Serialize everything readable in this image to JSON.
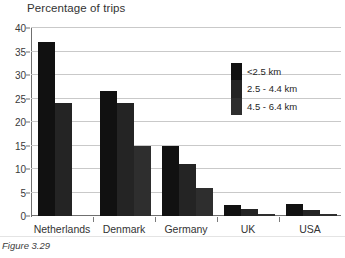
{
  "chart_data": {
    "type": "bar",
    "title": "Percentage of trips",
    "xlabel": "",
    "ylabel": "",
    "ylim": [
      0,
      40
    ],
    "yticks": [
      0,
      5,
      10,
      15,
      20,
      25,
      30,
      35,
      40
    ],
    "grid": true,
    "legend_position": "inside-right",
    "categories": [
      "Netherlands",
      "Denmark",
      "Germany",
      "UK",
      "USA"
    ],
    "series": [
      {
        "name": "<2.5 km",
        "color": "#111111",
        "values": [
          37,
          26.5,
          15,
          2.3,
          2.5
        ]
      },
      {
        "name": "2.5 - 4.4 km",
        "color": "#242424",
        "values": [
          24,
          24,
          11,
          1.5,
          1.3
        ]
      },
      {
        "name": "4.5 - 6.4 km",
        "color": "#2e2e2e",
        "values": [
          null,
          15,
          6,
          0.5,
          0.4
        ]
      }
    ]
  },
  "caption": "Figure 3.29"
}
